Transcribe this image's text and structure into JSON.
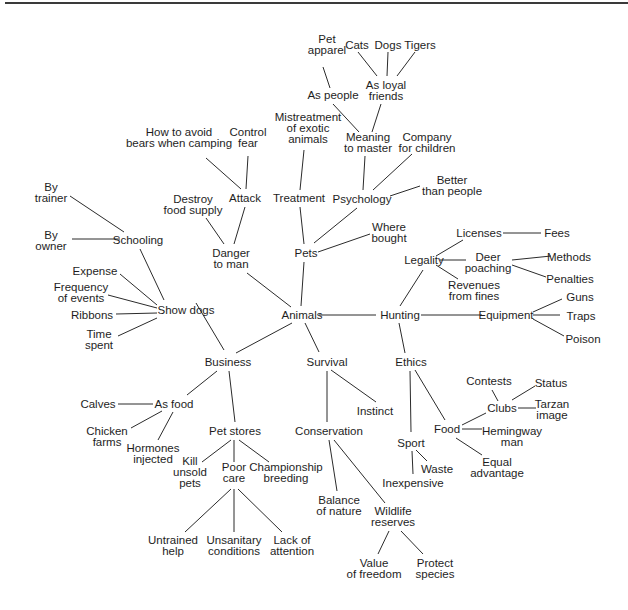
{
  "diagram": {
    "type": "mind-map",
    "central_topic": "Animals",
    "colors": {
      "line": "#2b2b2b",
      "text": "#1e1e1e",
      "background": "#ffffff",
      "rule": "#3a3a3a"
    },
    "nodes": [
      {
        "id": "animals",
        "lines": [
          "Animals"
        ],
        "x": 302,
        "y": 315
      },
      {
        "id": "pets",
        "lines": [
          "Pets"
        ],
        "x": 306,
        "y": 253
      },
      {
        "id": "treatment",
        "lines": [
          "Treatment"
        ],
        "x": 299,
        "y": 198
      },
      {
        "id": "mistreatment",
        "lines": [
          "Mistreatment",
          "of exotic",
          "animals"
        ],
        "x": 308,
        "y": 128
      },
      {
        "id": "psychology",
        "lines": [
          "Psychology"
        ],
        "x": 362,
        "y": 199
      },
      {
        "id": "meaning",
        "lines": [
          "Meaning",
          "to master"
        ],
        "x": 368,
        "y": 142
      },
      {
        "id": "company",
        "lines": [
          "Company",
          "for children"
        ],
        "x": 427,
        "y": 142
      },
      {
        "id": "better",
        "lines": [
          "Better",
          "than people"
        ],
        "x": 452,
        "y": 185
      },
      {
        "id": "as-people",
        "lines": [
          "As people"
        ],
        "x": 333,
        "y": 95
      },
      {
        "id": "loyal",
        "lines": [
          "As loyal",
          "friends"
        ],
        "x": 386,
        "y": 90
      },
      {
        "id": "apparel",
        "lines": [
          "Pet",
          "apparel"
        ],
        "x": 327,
        "y": 44
      },
      {
        "id": "cats",
        "lines": [
          "Cats"
        ],
        "x": 357,
        "y": 45
      },
      {
        "id": "dogs",
        "lines": [
          "Dogs"
        ],
        "x": 388,
        "y": 45
      },
      {
        "id": "tigers",
        "lines": [
          "Tigers"
        ],
        "x": 420,
        "y": 45
      },
      {
        "id": "where",
        "lines": [
          "Where",
          "bought"
        ],
        "x": 389,
        "y": 232
      },
      {
        "id": "danger",
        "lines": [
          "Danger",
          "to man"
        ],
        "x": 231,
        "y": 258
      },
      {
        "id": "attack",
        "lines": [
          "Attack"
        ],
        "x": 245,
        "y": 198
      },
      {
        "id": "destroy",
        "lines": [
          "Destroy",
          "food supply"
        ],
        "x": 193,
        "y": 204
      },
      {
        "id": "bears",
        "lines": [
          "How to avoid",
          "bears when camping"
        ],
        "x": 179,
        "y": 137
      },
      {
        "id": "fear",
        "lines": [
          "Control",
          "fear"
        ],
        "x": 248,
        "y": 137
      },
      {
        "id": "showdogs",
        "lines": [
          "Show dogs"
        ],
        "x": 186,
        "y": 310
      },
      {
        "id": "schooling",
        "lines": [
          "Schooling"
        ],
        "x": 138,
        "y": 240
      },
      {
        "id": "trainer",
        "lines": [
          "By",
          "trainer"
        ],
        "x": 51,
        "y": 192
      },
      {
        "id": "owner",
        "lines": [
          "By",
          "owner"
        ],
        "x": 51,
        "y": 240
      },
      {
        "id": "expense",
        "lines": [
          "Expense"
        ],
        "x": 95,
        "y": 271
      },
      {
        "id": "frequency",
        "lines": [
          "Frequency",
          "of events"
        ],
        "x": 81,
        "y": 292
      },
      {
        "id": "ribbons",
        "lines": [
          "Ribbons"
        ],
        "x": 92,
        "y": 315
      },
      {
        "id": "time",
        "lines": [
          "Time",
          "spent"
        ],
        "x": 99,
        "y": 339
      },
      {
        "id": "business",
        "lines": [
          "Business"
        ],
        "x": 228,
        "y": 362
      },
      {
        "id": "asfood",
        "lines": [
          "As food"
        ],
        "x": 174,
        "y": 404
      },
      {
        "id": "calves",
        "lines": [
          "Calves"
        ],
        "x": 98,
        "y": 404
      },
      {
        "id": "chicken",
        "lines": [
          "Chicken",
          "farms"
        ],
        "x": 107,
        "y": 436
      },
      {
        "id": "hormones",
        "lines": [
          "Hormones",
          "injected"
        ],
        "x": 153,
        "y": 453
      },
      {
        "id": "petstores",
        "lines": [
          "Pet stores"
        ],
        "x": 235,
        "y": 431
      },
      {
        "id": "kill",
        "lines": [
          "Kill",
          "unsold",
          "pets"
        ],
        "x": 190,
        "y": 472
      },
      {
        "id": "poorcare",
        "lines": [
          "Poor",
          "care"
        ],
        "x": 234,
        "y": 472
      },
      {
        "id": "champ",
        "lines": [
          "Championship",
          "breeding"
        ],
        "x": 286,
        "y": 472
      },
      {
        "id": "untrained",
        "lines": [
          "Untrained",
          "help"
        ],
        "x": 173,
        "y": 545
      },
      {
        "id": "unsanitary",
        "lines": [
          "Unsanitary",
          "conditions"
        ],
        "x": 234,
        "y": 545
      },
      {
        "id": "lack",
        "lines": [
          "Lack of",
          "attention"
        ],
        "x": 292,
        "y": 545
      },
      {
        "id": "survival",
        "lines": [
          "Survival"
        ],
        "x": 327,
        "y": 362
      },
      {
        "id": "instinct",
        "lines": [
          "Instinct"
        ],
        "x": 375,
        "y": 411
      },
      {
        "id": "conservation",
        "lines": [
          "Conservation"
        ],
        "x": 329,
        "y": 431
      },
      {
        "id": "balance",
        "lines": [
          "Balance",
          "of nature"
        ],
        "x": 339,
        "y": 505
      },
      {
        "id": "wildlife",
        "lines": [
          "Wildlife",
          "reserves"
        ],
        "x": 393,
        "y": 516
      },
      {
        "id": "freedom",
        "lines": [
          "Value",
          "of freedom"
        ],
        "x": 374,
        "y": 568
      },
      {
        "id": "protect",
        "lines": [
          "Protect",
          "species"
        ],
        "x": 435,
        "y": 568
      },
      {
        "id": "hunting",
        "lines": [
          "Hunting"
        ],
        "x": 400,
        "y": 315
      },
      {
        "id": "legality",
        "lines": [
          "Legality"
        ],
        "x": 424,
        "y": 260
      },
      {
        "id": "licenses",
        "lines": [
          "Licenses"
        ],
        "x": 479,
        "y": 233
      },
      {
        "id": "fees",
        "lines": [
          "Fees"
        ],
        "x": 557,
        "y": 233
      },
      {
        "id": "deer",
        "lines": [
          "Deer",
          "poaching"
        ],
        "x": 488,
        "y": 262
      },
      {
        "id": "methods",
        "lines": [
          "Methods"
        ],
        "x": 569,
        "y": 257
      },
      {
        "id": "penalties",
        "lines": [
          "Penalties"
        ],
        "x": 570,
        "y": 279
      },
      {
        "id": "revenues",
        "lines": [
          "Revenues",
          "from fines"
        ],
        "x": 474,
        "y": 290
      },
      {
        "id": "equipment",
        "lines": [
          "Equipment"
        ],
        "x": 506,
        "y": 315
      },
      {
        "id": "guns",
        "lines": [
          "Guns"
        ],
        "x": 580,
        "y": 297
      },
      {
        "id": "traps",
        "lines": [
          "Traps"
        ],
        "x": 581,
        "y": 316
      },
      {
        "id": "poison",
        "lines": [
          "Poison"
        ],
        "x": 583,
        "y": 339
      },
      {
        "id": "ethics",
        "lines": [
          "Ethics"
        ],
        "x": 411,
        "y": 362
      },
      {
        "id": "sport",
        "lines": [
          "Sport"
        ],
        "x": 411,
        "y": 443
      },
      {
        "id": "waste",
        "lines": [
          "Waste"
        ],
        "x": 437,
        "y": 469
      },
      {
        "id": "inexpensive",
        "lines": [
          "Inexpensive"
        ],
        "x": 413,
        "y": 483
      },
      {
        "id": "food",
        "lines": [
          "Food"
        ],
        "x": 447,
        "y": 429
      },
      {
        "id": "clubs",
        "lines": [
          "Clubs"
        ],
        "x": 502,
        "y": 408
      },
      {
        "id": "contests",
        "lines": [
          "Contests"
        ],
        "x": 489,
        "y": 381
      },
      {
        "id": "status",
        "lines": [
          "Status"
        ],
        "x": 551,
        "y": 383
      },
      {
        "id": "tarzan",
        "lines": [
          "Tarzan",
          "image"
        ],
        "x": 552,
        "y": 409
      },
      {
        "id": "hemingway",
        "lines": [
          "Hemingway",
          "man"
        ],
        "x": 512,
        "y": 436
      },
      {
        "id": "equal",
        "lines": [
          "Equal",
          "advantage"
        ],
        "x": 497,
        "y": 467
      }
    ],
    "edges": [
      [
        301,
        306,
        304,
        262
      ],
      [
        291,
        307,
        247,
        273
      ],
      [
        319,
        315,
        376,
        315
      ],
      [
        292,
        323,
        236,
        353
      ],
      [
        305,
        323,
        319,
        352
      ],
      [
        304,
        244,
        300,
        207
      ],
      [
        300,
        190,
        304,
        150
      ],
      [
        314,
        243,
        357,
        208
      ],
      [
        318,
        252,
        370,
        234
      ],
      [
        363,
        190,
        365,
        156
      ],
      [
        373,
        190,
        412,
        154
      ],
      [
        390,
        196,
        420,
        186
      ],
      [
        359,
        132,
        333,
        104
      ],
      [
        372,
        132,
        381,
        104
      ],
      [
        330,
        88,
        323,
        67
      ],
      [
        377,
        76,
        358,
        52
      ],
      [
        387,
        76,
        388,
        52
      ],
      [
        397,
        76,
        415,
        52
      ],
      [
        234,
        244,
        245,
        207
      ],
      [
        224,
        244,
        206,
        218
      ],
      [
        241,
        189,
        206,
        158
      ],
      [
        246,
        189,
        248,
        156
      ],
      [
        196,
        303,
        224,
        350
      ],
      [
        164,
        300,
        140,
        249
      ],
      [
        124,
        232,
        70,
        196
      ],
      [
        120,
        239,
        72,
        239
      ],
      [
        157,
        305,
        120,
        274
      ],
      [
        157,
        308,
        108,
        295
      ],
      [
        157,
        313,
        116,
        314
      ],
      [
        157,
        318,
        118,
        336
      ],
      [
        217,
        371,
        187,
        395
      ],
      [
        229,
        371,
        235,
        422
      ],
      [
        153,
        404,
        118,
        404
      ],
      [
        162,
        411,
        131,
        428
      ],
      [
        173,
        412,
        158,
        440
      ],
      [
        231,
        440,
        202,
        462
      ],
      [
        234,
        440,
        234,
        462
      ],
      [
        239,
        440,
        269,
        462
      ],
      [
        231,
        489,
        185,
        532
      ],
      [
        234,
        489,
        234,
        532
      ],
      [
        238,
        489,
        282,
        532
      ],
      [
        327,
        371,
        327,
        422
      ],
      [
        331,
        370,
        376,
        402
      ],
      [
        329,
        440,
        337,
        491
      ],
      [
        334,
        440,
        385,
        503
      ],
      [
        389,
        531,
        378,
        554
      ],
      [
        401,
        531,
        423,
        554
      ],
      [
        400,
        306,
        423,
        270
      ],
      [
        399,
        323,
        405,
        353
      ],
      [
        421,
        315,
        482,
        315
      ],
      [
        436,
        256,
        463,
        240
      ],
      [
        440,
        260,
        466,
        260
      ],
      [
        436,
        265,
        458,
        279
      ],
      [
        503,
        233,
        541,
        233
      ],
      [
        512,
        260,
        551,
        256
      ],
      [
        512,
        265,
        546,
        277
      ],
      [
        533,
        312,
        562,
        299
      ],
      [
        533,
        315,
        560,
        315
      ],
      [
        533,
        319,
        564,
        336
      ],
      [
        410,
        371,
        411,
        432
      ],
      [
        412,
        451,
        413,
        474
      ],
      [
        416,
        450,
        427,
        461
      ],
      [
        415,
        370,
        445,
        420
      ],
      [
        462,
        425,
        486,
        413
      ],
      [
        462,
        429,
        482,
        429
      ],
      [
        456,
        438,
        482,
        455
      ],
      [
        498,
        401,
        492,
        390
      ],
      [
        512,
        400,
        535,
        386
      ],
      [
        518,
        408,
        536,
        408
      ]
    ]
  }
}
